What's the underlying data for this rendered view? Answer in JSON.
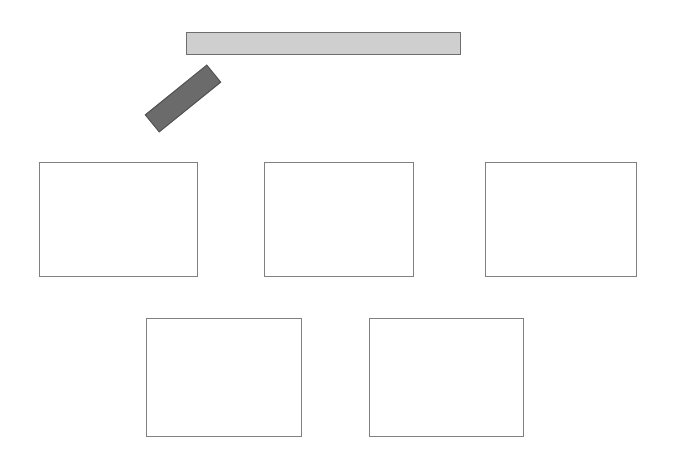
{
  "canvas": {
    "width": 674,
    "height": 475,
    "background_color": "#ffffff",
    "title": "Shape Layout Canvas"
  },
  "palette": {
    "light_fill": "#cfcfcf",
    "light_stroke": "#6e6e6e",
    "dark_fill": "#6b6b6b",
    "dark_stroke": "#4f4f4f",
    "panel_fill": "#ffffff",
    "panel_stroke": "#808080"
  },
  "shapes": {
    "horizontal_bar": {
      "name": "horizontal-bar",
      "label": "",
      "x": 186,
      "y": 32,
      "width": 275,
      "height": 23,
      "rotation": 0,
      "fill": "#cfcfcf",
      "stroke": "#6e6e6e"
    },
    "tilted_bar": {
      "name": "tilted-bar",
      "label": "",
      "x": 143,
      "y": 87,
      "width": 80,
      "height": 23,
      "rotation": -39,
      "fill": "#6b6b6b",
      "stroke": "#4f4f4f"
    }
  },
  "panels": {
    "row_one": [
      {
        "name": "panel-1",
        "label": "",
        "x": 39,
        "y": 162,
        "width": 159,
        "height": 115
      },
      {
        "name": "panel-2",
        "label": "",
        "x": 264,
        "y": 162,
        "width": 150,
        "height": 115
      },
      {
        "name": "panel-3",
        "label": "",
        "x": 485,
        "y": 162,
        "width": 152,
        "height": 115
      }
    ],
    "row_two": [
      {
        "name": "panel-4",
        "label": "",
        "x": 146,
        "y": 318,
        "width": 156,
        "height": 119
      },
      {
        "name": "panel-5",
        "label": "",
        "x": 369,
        "y": 318,
        "width": 155,
        "height": 119
      }
    ]
  }
}
